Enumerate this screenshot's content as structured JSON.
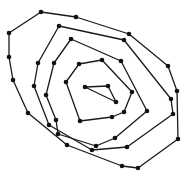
{
  "diagram": {
    "type": "nested-polygon-spiral",
    "width": 183,
    "height": 180,
    "colors": {
      "background": "#ffffff",
      "line": "#1a1a1a",
      "node": "#111111"
    },
    "node_radius": 2.3,
    "rings": [
      {
        "name": "outer-ring",
        "closed": true,
        "points": [
          [
            41,
            12
          ],
          [
            76,
            17
          ],
          [
            129,
            34
          ],
          [
            168,
            66
          ],
          [
            177,
            91
          ],
          [
            178,
            139
          ],
          [
            138,
            168
          ],
          [
            122,
            166
          ],
          [
            67,
            145
          ],
          [
            28,
            113
          ],
          [
            13,
            80
          ],
          [
            9,
            57
          ],
          [
            9,
            33
          ]
        ]
      },
      {
        "name": "ring-4",
        "closed": true,
        "points": [
          [
            59,
            26
          ],
          [
            124,
            40
          ],
          [
            171,
            99
          ],
          [
            173,
            114
          ],
          [
            127,
            147
          ],
          [
            92,
            150
          ],
          [
            49,
            125
          ],
          [
            34,
            86
          ],
          [
            38,
            63
          ]
        ]
      },
      {
        "name": "ring-3",
        "closed": true,
        "points": [
          [
            71,
            39
          ],
          [
            121,
            61
          ],
          [
            147,
            111
          ],
          [
            115,
            138
          ],
          [
            96,
            146
          ],
          [
            58,
            134
          ],
          [
            56,
            120
          ],
          [
            46,
            95
          ],
          [
            54,
            63
          ]
        ]
      },
      {
        "name": "ring-2",
        "closed": true,
        "points": [
          [
            79,
            64
          ],
          [
            102,
            60
          ],
          [
            132,
            92
          ],
          [
            124,
            112
          ],
          [
            112,
            117
          ],
          [
            80,
            121
          ],
          [
            66,
            82
          ]
        ]
      },
      {
        "name": "inner-triangle",
        "closed": true,
        "points": [
          [
            85,
            87
          ],
          [
            108,
            86
          ],
          [
            116,
            102
          ]
        ]
      }
    ]
  }
}
